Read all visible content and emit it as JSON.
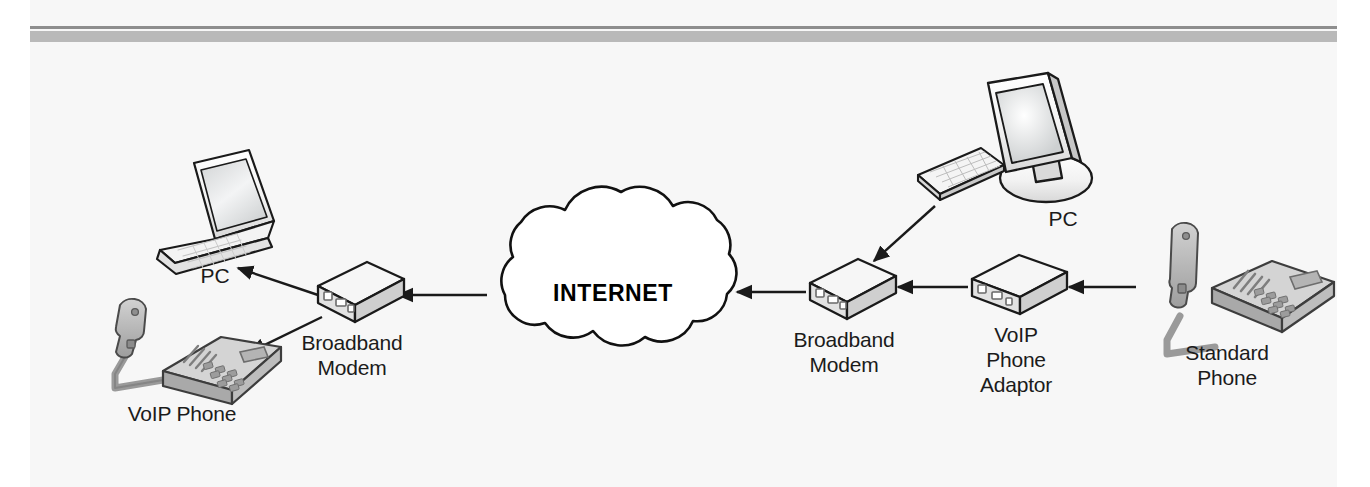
{
  "page": {
    "background_color": "#f7f7f7",
    "rule_thin_color": "#8e8e8e",
    "rule_thick_color": "#b9b9b9"
  },
  "diagram": {
    "cloud": {
      "label": "INTERNET"
    },
    "nodes": [
      {
        "id": "pc-left",
        "label": "PC",
        "icon": "laptop-icon",
        "x": 215,
        "y": 275
      },
      {
        "id": "voip-phone-left",
        "label": "VoIP Phone",
        "icon": "voip-phone-icon",
        "x": 182,
        "y": 413
      },
      {
        "id": "broadband-modem-left",
        "label": "Broadband\nModem",
        "icon": "modem-icon",
        "x": 352,
        "y": 350
      },
      {
        "id": "broadband-modem-right",
        "label": "Broadband\nModem",
        "icon": "modem-icon",
        "x": 844,
        "y": 332
      },
      {
        "id": "voip-adaptor",
        "label": "VoIP\nPhone\nAdaptor",
        "icon": "voip-adaptor-icon",
        "x": 1016,
        "y": 327
      },
      {
        "id": "pc-right",
        "label": "PC",
        "icon": "desktop-computer-icon",
        "x": 1063,
        "y": 216
      },
      {
        "id": "standard-phone",
        "label": "Standard\nPhone",
        "icon": "standard-phone-icon",
        "x": 1227,
        "y": 358
      }
    ],
    "connections": [
      {
        "from": "broadband-modem-left",
        "to": "pc-left",
        "style": "arrow"
      },
      {
        "from": "broadband-modem-left",
        "to": "voip-phone-left",
        "style": "arrow"
      },
      {
        "from": "internet-cloud",
        "to": "broadband-modem-left",
        "style": "arrow"
      },
      {
        "from": "broadband-modem-right",
        "to": "internet-cloud",
        "style": "arrow"
      },
      {
        "from": "pc-right",
        "to": "broadband-modem-right",
        "style": "arrow"
      },
      {
        "from": "voip-adaptor",
        "to": "broadband-modem-right",
        "style": "arrow"
      },
      {
        "from": "standard-phone",
        "to": "voip-adaptor",
        "style": "arrow"
      }
    ]
  }
}
